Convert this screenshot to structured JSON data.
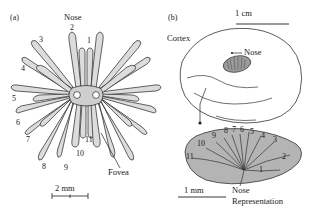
{
  "figure": {
    "panels": [
      {
        "tag": "(a)",
        "title": "Nose",
        "description": "Star-nosed mole nose showing 11 pairs of radial rays",
        "ray_labels": [
          "1",
          "2",
          "3",
          "4",
          "5",
          "6",
          "7",
          "8",
          "9",
          "10",
          "11"
        ],
        "fovea_label": "Fovea",
        "scale_bar": "2 mm"
      },
      {
        "tag": "(b)",
        "cortex_label": "Cortex",
        "nose_label": "Nose",
        "scale_bar_cortex": "1 cm",
        "scale_bar_detail": "1 mm",
        "representation_label_line1": "Nose",
        "representation_label_line2": "Representation",
        "segment_labels": [
          "1",
          "2",
          "3",
          "4",
          "5",
          "6",
          "7",
          "8",
          "9",
          "10",
          "11"
        ]
      }
    ],
    "colors": {
      "ray_fill": "#dcdcdc",
      "ray_fill_dark": "#cfcfcf",
      "outline": "#222222",
      "cortex_outline": "#333333",
      "blob_fill": "#b4b4b4",
      "patch_fill": "#9a9a9a",
      "background": "#ffffff"
    }
  }
}
